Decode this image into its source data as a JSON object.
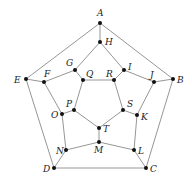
{
  "diagram": {
    "type": "graph",
    "nodes": [
      {
        "id": "A",
        "x": 100,
        "y": 23,
        "lx": 97,
        "ly": 16
      },
      {
        "id": "B",
        "x": 173,
        "y": 79,
        "lx": 177,
        "ly": 83
      },
      {
        "id": "C",
        "x": 146,
        "y": 168,
        "lx": 150,
        "ly": 172
      },
      {
        "id": "D",
        "x": 54,
        "y": 168,
        "lx": 43,
        "ly": 172
      },
      {
        "id": "E",
        "x": 26,
        "y": 79,
        "lx": 14,
        "ly": 83
      },
      {
        "id": "F",
        "x": 44,
        "y": 82,
        "lx": 44,
        "ly": 77
      },
      {
        "id": "G",
        "x": 75,
        "y": 70,
        "lx": 66,
        "ly": 66
      },
      {
        "id": "H",
        "x": 100,
        "y": 42,
        "lx": 105,
        "ly": 45
      },
      {
        "id": "I",
        "x": 124,
        "y": 70,
        "lx": 128,
        "ly": 70
      },
      {
        "id": "J",
        "x": 154,
        "y": 82,
        "lx": 150,
        "ly": 78
      },
      {
        "id": "K",
        "x": 137,
        "y": 115,
        "lx": 141,
        "ly": 120
      },
      {
        "id": "L",
        "x": 134,
        "y": 150,
        "lx": 138,
        "ly": 154
      },
      {
        "id": "M",
        "x": 99,
        "y": 142,
        "lx": 94,
        "ly": 153
      },
      {
        "id": "N",
        "x": 66,
        "y": 150,
        "lx": 56,
        "ly": 154
      },
      {
        "id": "O",
        "x": 62,
        "y": 114,
        "lx": 51,
        "ly": 118
      },
      {
        "id": "P",
        "x": 74,
        "y": 110,
        "lx": 66,
        "ly": 107
      },
      {
        "id": "Q",
        "x": 83,
        "y": 80,
        "lx": 86,
        "ly": 77
      },
      {
        "id": "R",
        "x": 114,
        "y": 80,
        "lx": 106,
        "ly": 77
      },
      {
        "id": "S",
        "x": 123,
        "y": 110,
        "lx": 127,
        "ly": 107
      },
      {
        "id": "T",
        "x": 99,
        "y": 128,
        "lx": 103,
        "ly": 132
      }
    ],
    "edges": [
      [
        "A",
        "B"
      ],
      [
        "B",
        "C"
      ],
      [
        "C",
        "D"
      ],
      [
        "D",
        "E"
      ],
      [
        "E",
        "A"
      ],
      [
        "A",
        "H"
      ],
      [
        "B",
        "J"
      ],
      [
        "C",
        "L"
      ],
      [
        "D",
        "N"
      ],
      [
        "E",
        "F"
      ],
      [
        "H",
        "G"
      ],
      [
        "G",
        "F"
      ],
      [
        "F",
        "O"
      ],
      [
        "O",
        "N"
      ],
      [
        "N",
        "M"
      ],
      [
        "M",
        "L"
      ],
      [
        "L",
        "K"
      ],
      [
        "K",
        "J"
      ],
      [
        "J",
        "I"
      ],
      [
        "I",
        "H"
      ],
      [
        "G",
        "Q"
      ],
      [
        "I",
        "R"
      ],
      [
        "K",
        "S"
      ],
      [
        "M",
        "T"
      ],
      [
        "O",
        "P"
      ],
      [
        "Q",
        "R"
      ],
      [
        "R",
        "S"
      ],
      [
        "S",
        "T"
      ],
      [
        "T",
        "P"
      ],
      [
        "P",
        "Q"
      ]
    ]
  }
}
